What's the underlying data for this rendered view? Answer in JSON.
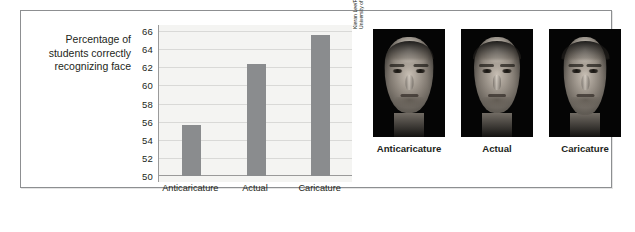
{
  "figure": {
    "axis_caption": "Percentage of students correctly recognizing face",
    "photo_credit": "Kieran Lee/Facelab, Department of Psychology, University of Western Australia"
  },
  "chart_data": {
    "type": "bar",
    "title": "",
    "xlabel": "",
    "ylabel": "Percentage of students correctly recognizing face",
    "categories": [
      "Anticaricature",
      "Actual",
      "Caricature"
    ],
    "values": [
      55.6,
      62.4,
      65.6
    ],
    "ylim": [
      50,
      66
    ],
    "yticks": [
      66,
      64,
      62,
      60,
      58,
      56,
      54,
      52,
      50
    ],
    "ytick_labels": [
      "66",
      "64",
      "62",
      "60",
      "58",
      "56",
      "54",
      "52",
      "50"
    ],
    "grid": true,
    "legend": "none",
    "bar_color": "#8a8c8e",
    "plot_background": "#f4f4f2"
  },
  "faces": [
    {
      "id": "anticaricature",
      "caption": "Anticaricature"
    },
    {
      "id": "actual",
      "caption": "Actual"
    },
    {
      "id": "caricature",
      "caption": "Caricature"
    }
  ]
}
